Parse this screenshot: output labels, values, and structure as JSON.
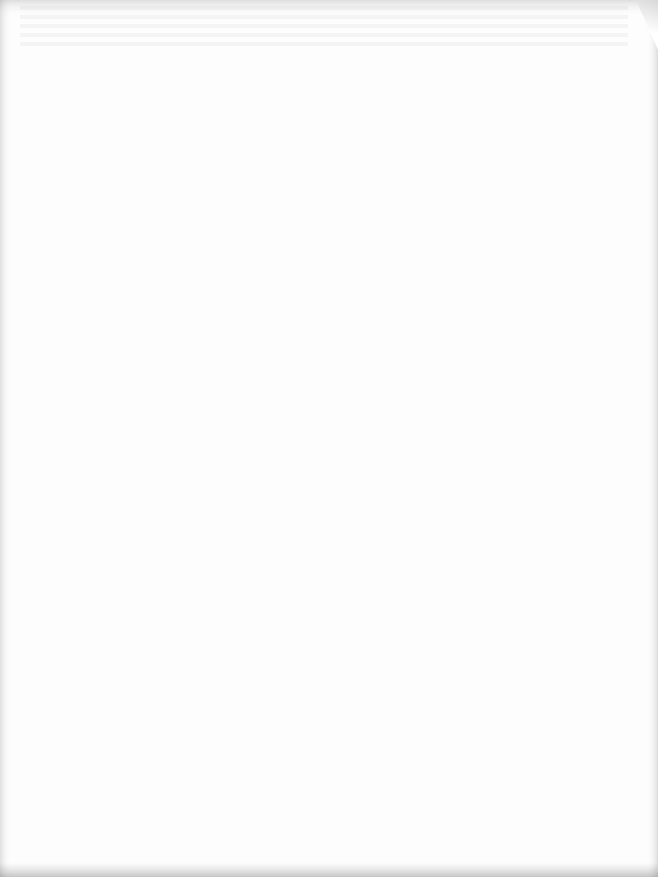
{
  "page": {
    "type": "blank scanned page",
    "text": ""
  }
}
